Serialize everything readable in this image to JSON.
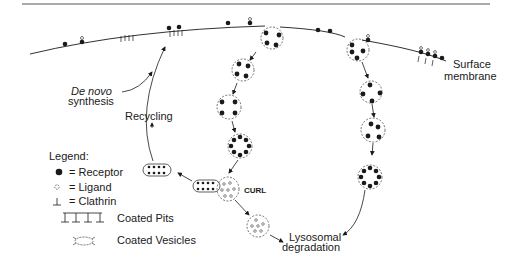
{
  "diagram": {
    "labels": {
      "surface_line1": "Surface",
      "surface_line2": "membrane",
      "denovo_line1": "De novo",
      "denovo_line2": "synthesis",
      "recycling": "Recycling",
      "curl": "CURL",
      "lysosomal_line1": "Lysosomal",
      "lysosomal_line2": "degradation"
    },
    "legend": {
      "title": "Legend:",
      "items": [
        {
          "symbol": "filled-circle",
          "label": "= Receptor"
        },
        {
          "symbol": "open-circle",
          "label": "= Ligand"
        },
        {
          "symbol": "t-shape",
          "label": "= Clathrin"
        },
        {
          "symbol": "comb",
          "label": "Coated Pits"
        },
        {
          "symbol": "coated-vesicle",
          "label": "Coated Vesicles"
        }
      ]
    },
    "colors": {
      "ink": "#1a1a1a",
      "background": "#ffffff",
      "rule": "#555555"
    }
  }
}
